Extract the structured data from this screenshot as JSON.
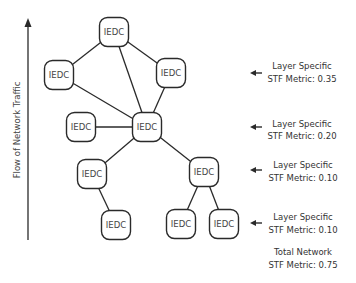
{
  "axis": {
    "label": "Flow of Network Traffic",
    "direction": "up"
  },
  "nodes": [
    {
      "id": "n0",
      "label": "IEDC"
    },
    {
      "id": "n1",
      "label": "IEDC"
    },
    {
      "id": "n2",
      "label": "IEDC"
    },
    {
      "id": "n3",
      "label": "IEDC"
    },
    {
      "id": "n4",
      "label": "IEDC"
    },
    {
      "id": "n5",
      "label": "IEDC"
    },
    {
      "id": "n6",
      "label": "IEDC"
    },
    {
      "id": "n7",
      "label": "IEDC"
    },
    {
      "id": "n8",
      "label": "IEDC"
    },
    {
      "id": "n9",
      "label": "IEDC"
    }
  ],
  "edges": [
    [
      "n0",
      "n1"
    ],
    [
      "n0",
      "n2"
    ],
    [
      "n0",
      "n4"
    ],
    [
      "n1",
      "n4"
    ],
    [
      "n2",
      "n4"
    ],
    [
      "n3",
      "n4"
    ],
    [
      "n4",
      "n5"
    ],
    [
      "n4",
      "n6"
    ],
    [
      "n5",
      "n7"
    ],
    [
      "n6",
      "n8"
    ],
    [
      "n6",
      "n9"
    ]
  ],
  "metrics": [
    {
      "line1": "Layer Specific",
      "line2": "STF Metric: 0.35"
    },
    {
      "line1": "Layer Specific",
      "line2": "STF Metric: 0.20"
    },
    {
      "line1": "Layer Specific",
      "line2": "STF Metric: 0.10"
    },
    {
      "line1": "Layer Specific",
      "line2": "STF Metric: 0.10"
    }
  ],
  "total": {
    "line1": "Total Network",
    "line2": "STF Metric: 0.75"
  }
}
